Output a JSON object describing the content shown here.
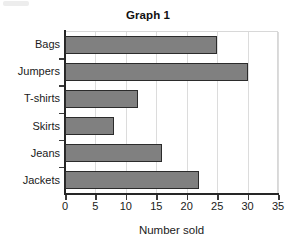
{
  "chart_data": {
    "type": "bar",
    "orientation": "horizontal",
    "title": "Graph 1",
    "xlabel": "Number sold",
    "ylabel": "",
    "categories": [
      "Bags",
      "Jumpers",
      "T-shirts",
      "Skirts",
      "Jeans",
      "Jackets"
    ],
    "values": [
      25,
      30,
      12,
      8,
      16,
      22
    ],
    "xlim": [
      0,
      35
    ],
    "xticks": [
      0,
      5,
      10,
      15,
      20,
      25,
      30,
      35
    ],
    "xtick_labels": [
      "0",
      "5",
      "10",
      "15",
      "20",
      "25",
      "30",
      "35"
    ],
    "grid": "vertical",
    "legend": "none",
    "series": [
      {
        "name": "Number sold",
        "values": [
          25,
          30,
          12,
          8,
          16,
          22
        ]
      }
    ],
    "colors": {
      "bar_fill": "#808080",
      "bar_border": "#2b2b2b",
      "gridline": "#dcdcdc",
      "axis": "#262626",
      "text": "#1a1a1a",
      "background": "#ffffff"
    }
  }
}
